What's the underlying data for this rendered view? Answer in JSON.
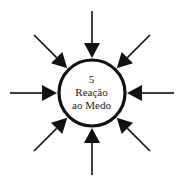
{
  "diagram": {
    "center_number": "5",
    "title_line1": "Reação",
    "title_line2": "ao Medo",
    "center": [
      92,
      93
    ],
    "radius": 33,
    "stroke_color": "#111111",
    "background_color": "#ffffff",
    "arrows": [
      {
        "direction": "from-top"
      },
      {
        "direction": "from-top-right"
      },
      {
        "direction": "from-right"
      },
      {
        "direction": "from-bottom-right"
      },
      {
        "direction": "from-bottom"
      },
      {
        "direction": "from-bottom-left"
      },
      {
        "direction": "from-left"
      },
      {
        "direction": "from-top-left"
      }
    ]
  }
}
